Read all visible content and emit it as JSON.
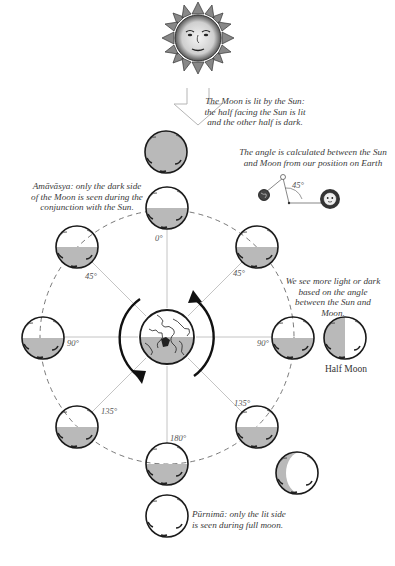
{
  "notes": {
    "lit_by_sun": "The Moon is lit by the Sun: the half facing the Sun is lit and the other half is dark.",
    "angle_calc": "The angle is calculated between the Sun and Moon from our position on Earth",
    "amavasya": "Amāvāsya: only the dark side of the Moon is seen during the conjunction with the Sun.",
    "more_light": "We see more light or dark based on the angle between the Sun and Moon.",
    "purnima": "Pūrnimā: only the lit side is seen during full moon.",
    "half_moon": "Half Moon"
  },
  "angle_inset": {
    "angle_label": "45°"
  },
  "orbit_angles": {
    "top": "0°",
    "upper_left": "45°",
    "upper_right": "45°",
    "left": "90°",
    "right": "90°",
    "lower_left": "135°",
    "lower_right": "135°",
    "bottom": "180°"
  },
  "colors": {
    "shade": "#b9b9b9",
    "outline": "#1a1a1a",
    "guide": "#bdbdbd",
    "dash": "#6a6a6a"
  }
}
